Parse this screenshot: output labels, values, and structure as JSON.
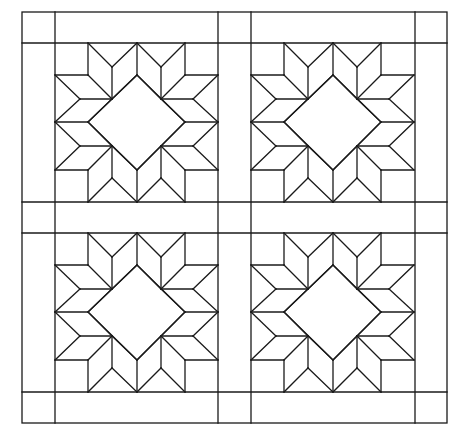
{
  "diagram": {
    "title": "",
    "type": "quilt-pattern",
    "pattern_name": "carpenter-wheel-star",
    "canvas": {
      "width": 463,
      "height": 435,
      "background": "#ffffff",
      "stroke": "#1a1a1a"
    },
    "outer_border": {
      "x1": 22,
      "y1": 12,
      "x2": 447,
      "y2": 423
    },
    "sashing": {
      "vertical_lines_x": [
        55,
        218,
        251,
        415
      ],
      "horizontal_lines_y": [
        43,
        202,
        233,
        392
      ]
    },
    "block_size": {
      "width": 163,
      "height": 159
    },
    "blocks": [
      {
        "id": "block-top-left",
        "x": 55,
        "y": 43
      },
      {
        "id": "block-top-right",
        "x": 251,
        "y": 43
      },
      {
        "id": "block-bottom-left",
        "x": 55,
        "y": 233
      },
      {
        "id": "block-bottom-right",
        "x": 251,
        "y": 233
      }
    ],
    "block_grid": {
      "xs": [
        0,
        25,
        33,
        57,
        82,
        106,
        130,
        138,
        163
      ],
      "ys": [
        0,
        24,
        32,
        56,
        79,
        103,
        127,
        135,
        159
      ]
    },
    "center_diamond": "square rotated 45°, vertices at top (82,32), right (130,79), bottom (82,127), left (33,79)",
    "star_points": 8,
    "rhombus_count_per_block": 16
  }
}
